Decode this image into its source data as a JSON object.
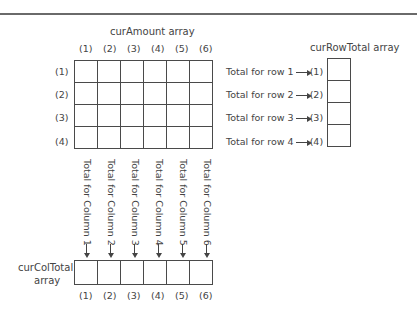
{
  "amount_array": {
    "title": "curAmount array",
    "col_labels": [
      "(1)",
      "(2)",
      "(3)",
      "(4)",
      "(5)",
      "(6)"
    ],
    "row_labels": [
      "(1)",
      "(2)",
      "(3)",
      "(4)"
    ],
    "rows": 4,
    "cols": 6
  },
  "row_total_array": {
    "title": "curRowTotal array",
    "entries": [
      {
        "text": "Total for row 1",
        "index": "(1)"
      },
      {
        "text": "Total for row 2",
        "index": "(2)"
      },
      {
        "text": "Total for row 3",
        "index": "(3)"
      },
      {
        "text": "Total for row 4",
        "index": "(4)"
      }
    ]
  },
  "col_total_array": {
    "title_line1": "curColTotal",
    "title_line2": "array",
    "column_texts": [
      "Total for Column 1",
      "Total for Column 2",
      "Total for Column 3",
      "Total for Column 4",
      "Total for Column 5",
      "Total for Column 6"
    ],
    "index_labels": [
      "(1)",
      "(2)",
      "(3)",
      "(4)",
      "(5)",
      "(6)"
    ]
  }
}
